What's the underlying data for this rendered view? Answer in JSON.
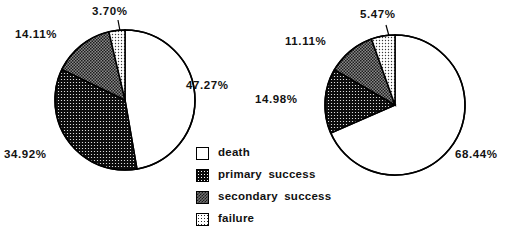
{
  "chart_data": [
    {
      "type": "pie",
      "title": "",
      "id": "left-pie",
      "categories": [
        "death",
        "primary success",
        "secondary success",
        "failure"
      ],
      "values": [
        47.27,
        34.92,
        14.11,
        3.7
      ],
      "labels": [
        "47.27%",
        "34.92%",
        "14.11%",
        "3.70%"
      ],
      "units": "percent",
      "start_angle_deg": 0,
      "direction": "clockwise",
      "legend_position": "center",
      "grid": false,
      "center": {
        "x": 125,
        "y": 100
      },
      "radius": 70
    },
    {
      "type": "pie",
      "title": "",
      "id": "right-pie",
      "categories": [
        "death",
        "primary success",
        "secondary success",
        "failure"
      ],
      "values": [
        68.44,
        14.98,
        11.11,
        5.47
      ],
      "labels": [
        "68.44%",
        "14.98%",
        "11.11%",
        "5.47%"
      ],
      "units": "percent",
      "start_angle_deg": 0,
      "direction": "clockwise",
      "legend_position": "center",
      "grid": false,
      "center": {
        "x": 395,
        "y": 105
      },
      "radius": 70
    }
  ],
  "left_chart": {
    "death_label": "47.27%",
    "primary_label": "34.92%",
    "secondary_label": "14.11%",
    "failure_label": "3.70%"
  },
  "right_chart": {
    "death_label": "68.44%",
    "primary_label": "14.98%",
    "secondary_label": "11.11%",
    "failure_label": "5.47%"
  },
  "legend": {
    "items": [
      {
        "label": "death",
        "pattern": "white-empty",
        "color": "#ffffff"
      },
      {
        "label": "primary  success",
        "pattern": "dark-dotted",
        "color": "#0c0c0c"
      },
      {
        "label": "secondary  success",
        "pattern": "gray-checker",
        "color": "#6f6f6f"
      },
      {
        "label": "failure",
        "pattern": "light-dotted",
        "color": "#e8e8e8"
      }
    ]
  }
}
